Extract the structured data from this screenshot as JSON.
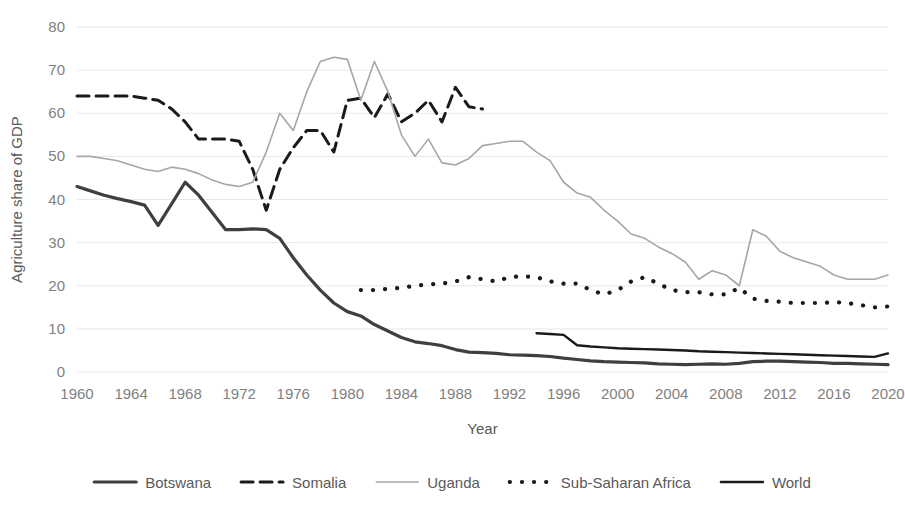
{
  "chart_data": {
    "type": "line",
    "title": "",
    "xlabel": "Year",
    "ylabel": "Agriculture share of GDP",
    "xlim": [
      1960,
      2020
    ],
    "ylim": [
      0,
      80
    ],
    "ytick_step": 10,
    "xtick_step": 4,
    "grid": true,
    "legend_position": "bottom",
    "yticks": [
      "0",
      "10",
      "20",
      "30",
      "40",
      "50",
      "60",
      "70",
      "80"
    ],
    "xticks": [
      "1960",
      "1964",
      "1968",
      "1972",
      "1976",
      "1980",
      "1984",
      "1988",
      "1992",
      "1996",
      "2000",
      "2004",
      "2008",
      "2012",
      "2016",
      "2020"
    ],
    "series": [
      {
        "name": "Botswana",
        "style": "thick-solid",
        "color": "#3f3f3f",
        "stroke_width": 3.2,
        "dash": "",
        "x": [
          1960,
          1961,
          1962,
          1963,
          1964,
          1965,
          1966,
          1967,
          1968,
          1969,
          1970,
          1971,
          1972,
          1973,
          1974,
          1975,
          1976,
          1977,
          1978,
          1979,
          1980,
          1981,
          1982,
          1983,
          1984,
          1985,
          1986,
          1987,
          1988,
          1989,
          1990,
          1991,
          1992,
          1993,
          1994,
          1995,
          1996,
          1997,
          1998,
          1999,
          2000,
          2001,
          2002,
          2003,
          2004,
          2005,
          2006,
          2007,
          2008,
          2009,
          2010,
          2011,
          2012,
          2013,
          2014,
          2015,
          2016,
          2017,
          2018,
          2019,
          2020
        ],
        "values": [
          43.0,
          42.0,
          41.0,
          40.2,
          39.5,
          38.7,
          34.0,
          39.0,
          44.0,
          41.0,
          37.0,
          33.0,
          33.0,
          33.2,
          33.0,
          31.0,
          26.5,
          22.5,
          19.0,
          16.0,
          14.0,
          13.0,
          11.0,
          9.5,
          8.0,
          7.0,
          6.6,
          6.1,
          5.2,
          4.6,
          4.5,
          4.3,
          4.0,
          3.9,
          3.8,
          3.6,
          3.2,
          2.9,
          2.6,
          2.4,
          2.3,
          2.2,
          2.1,
          1.9,
          1.8,
          1.7,
          1.8,
          1.9,
          1.8,
          2.0,
          2.4,
          2.5,
          2.5,
          2.4,
          2.3,
          2.2,
          2.0,
          2.0,
          1.9,
          1.8,
          1.7
        ]
      },
      {
        "name": "Somalia",
        "style": "dashed",
        "color": "#1a1a1a",
        "stroke_width": 3.0,
        "dash": "12,7",
        "x": [
          1960,
          1961,
          1962,
          1963,
          1964,
          1965,
          1966,
          1967,
          1968,
          1969,
          1970,
          1971,
          1972,
          1973,
          1974,
          1975,
          1976,
          1977,
          1978,
          1979,
          1980,
          1981,
          1982,
          1983,
          1984,
          1985,
          1986,
          1987,
          1988,
          1989,
          1990
        ],
        "values": [
          64.0,
          64.0,
          64.0,
          64.0,
          64.0,
          63.5,
          63.0,
          61.0,
          58.0,
          54.0,
          54.0,
          54.0,
          53.5,
          47.0,
          37.5,
          47.0,
          52.0,
          56.0,
          56.0,
          51.0,
          63.0,
          63.5,
          59.0,
          64.5,
          58.0,
          60.0,
          63.0,
          58.0,
          66.0,
          61.5,
          61.0
        ]
      },
      {
        "name": "Uganda",
        "style": "thin-solid",
        "color": "#a6a6a6",
        "stroke_width": 1.6,
        "dash": "",
        "x": [
          1960,
          1961,
          1962,
          1963,
          1964,
          1965,
          1966,
          1967,
          1968,
          1969,
          1970,
          1971,
          1972,
          1973,
          1974,
          1975,
          1976,
          1977,
          1978,
          1979,
          1980,
          1981,
          1982,
          1983,
          1984,
          1985,
          1986,
          1987,
          1988,
          1989,
          1990,
          1991,
          1992,
          1993,
          1994,
          1995,
          1996,
          1997,
          1998,
          1999,
          2000,
          2001,
          2002,
          2003,
          2004,
          2005,
          2006,
          2007,
          2008,
          2009,
          2010,
          2011,
          2012,
          2013,
          2014,
          2015,
          2016,
          2017,
          2018,
          2019,
          2020
        ],
        "values": [
          50.0,
          50.0,
          49.5,
          49.0,
          48.0,
          47.0,
          46.5,
          47.5,
          47.0,
          46.0,
          44.5,
          43.5,
          43.0,
          44.0,
          51.0,
          60.0,
          56.0,
          65.0,
          72.0,
          73.0,
          72.5,
          63.0,
          72.0,
          65.0,
          55.0,
          50.0,
          54.0,
          48.5,
          48.0,
          49.5,
          52.5,
          53.0,
          53.5,
          53.5,
          51.0,
          49.0,
          44.0,
          41.5,
          40.5,
          37.5,
          35.0,
          32.0,
          31.0,
          29.0,
          27.5,
          25.5,
          21.5,
          23.5,
          22.5,
          20.0,
          33.0,
          31.5,
          28.0,
          26.5,
          25.5,
          24.5,
          22.5,
          21.5,
          21.5,
          21.5,
          22.5
        ]
      },
      {
        "name": "Sub-Saharan Africa",
        "style": "dotted",
        "color": "#1a1a1a",
        "stroke_width": 4.2,
        "dash": "0.1,12",
        "x": [
          1981,
          1982,
          1983,
          1984,
          1985,
          1986,
          1987,
          1988,
          1989,
          1990,
          1991,
          1992,
          1993,
          1994,
          1995,
          1996,
          1997,
          1998,
          1999,
          2000,
          2001,
          2002,
          2003,
          2004,
          2005,
          2006,
          2007,
          2008,
          2009,
          2010,
          2011,
          2012,
          2013,
          2014,
          2015,
          2016,
          2017,
          2018,
          2019,
          2020
        ],
        "values": [
          19.0,
          19.0,
          19.3,
          19.5,
          20.0,
          20.3,
          20.5,
          21.0,
          22.0,
          21.5,
          21.0,
          22.0,
          22.2,
          22.0,
          21.0,
          20.5,
          20.5,
          19.0,
          18.0,
          19.0,
          21.0,
          22.0,
          20.5,
          19.0,
          18.5,
          18.5,
          18.0,
          18.0,
          19.5,
          17.0,
          16.5,
          16.3,
          16.0,
          16.0,
          16.0,
          16.2,
          16.0,
          15.5,
          15.0,
          15.2
        ]
      },
      {
        "name": "World",
        "style": "solid",
        "color": "#1a1a1a",
        "stroke_width": 2.4,
        "dash": "",
        "x": [
          1994,
          1995,
          1996,
          1997,
          1998,
          1999,
          2000,
          2001,
          2002,
          2003,
          2004,
          2005,
          2006,
          2007,
          2008,
          2009,
          2010,
          2011,
          2012,
          2013,
          2014,
          2015,
          2016,
          2017,
          2018,
          2019,
          2020
        ],
        "values": [
          9.0,
          8.8,
          8.6,
          6.2,
          5.9,
          5.7,
          5.5,
          5.4,
          5.3,
          5.2,
          5.1,
          5.0,
          4.8,
          4.7,
          4.6,
          4.5,
          4.4,
          4.3,
          4.2,
          4.1,
          4.0,
          3.9,
          3.8,
          3.7,
          3.6,
          3.5,
          4.3
        ]
      }
    ],
    "legend": [
      {
        "label": "Botswana",
        "style": "thick-solid"
      },
      {
        "label": "Somalia",
        "style": "dashed"
      },
      {
        "label": "Uganda",
        "style": "thin-solid"
      },
      {
        "label": "Sub-Saharan Africa",
        "style": "dotted"
      },
      {
        "label": "World",
        "style": "solid"
      }
    ]
  }
}
